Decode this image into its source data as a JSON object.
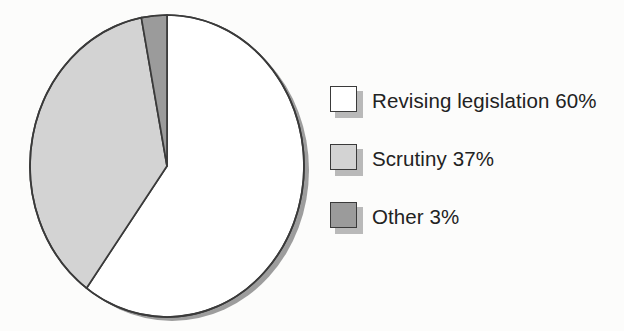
{
  "chart_data": {
    "type": "pie",
    "title": "",
    "subtitle": "",
    "xlabel": "",
    "ylabel": "",
    "grid": false,
    "legend_position": "right",
    "units": "percent",
    "start_angle_deg": 0,
    "direction": "clockwise",
    "total": 100,
    "categories": [
      "Revising legislation",
      "Scrutiny",
      "Other"
    ],
    "values": [
      60,
      37,
      3
    ],
    "labels": [
      "Revising legislation 60%",
      "Scrutiny 37%",
      "Other 3%"
    ],
    "slices": [
      {
        "name": "Revising legislation",
        "value": 60,
        "value_text": "60%",
        "legend_text": "Revising legislation 60%",
        "color": "#ffffff",
        "stroke": "#3a3a3a",
        "start_deg": 0,
        "end_deg": 216
      },
      {
        "name": "Scrutiny",
        "value": 37,
        "value_text": "37%",
        "legend_text": "Scrutiny 37%",
        "color": "#d3d3d3",
        "stroke": "#3a3a3a",
        "start_deg": 216,
        "end_deg": 349.2
      },
      {
        "name": "Other",
        "value": 3,
        "value_text": "3%",
        "legend_text": "Other 3%",
        "color": "#9b9b9b",
        "stroke": "#3a3a3a",
        "start_deg": 349.2,
        "end_deg": 360
      }
    ]
  },
  "legend": {
    "items": [
      {
        "label": "Revising legislation 60%",
        "color": "#ffffff"
      },
      {
        "label": "Scrutiny 37%",
        "color": "#d3d3d3"
      },
      {
        "label": "Other 3%",
        "color": "#9b9b9b"
      }
    ]
  },
  "colors": {
    "background": "#fcfcfb",
    "outline": "#3a3a3a",
    "shadow": "#9d9d9d",
    "swatch_shadow": "#b9b9b9",
    "text": "#222222",
    "slice_revising": "#ffffff",
    "slice_scrutiny": "#d3d3d3",
    "slice_other": "#9b9b9b"
  }
}
